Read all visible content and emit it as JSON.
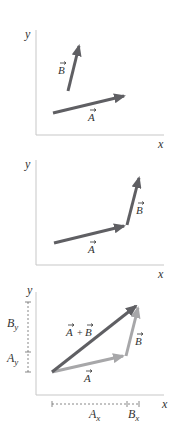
{
  "colors": {
    "vector_dark": "#5f5f63",
    "vector_light": "#a7a7a9",
    "axis": "#c7c7c7",
    "dashed": "#6a6a6a",
    "text": "#333333"
  },
  "panels": [
    {
      "axis_labels": {
        "x": "x",
        "y": "y"
      },
      "vectors": [
        {
          "name": "B",
          "label": "B"
        },
        {
          "name": "A",
          "label": "A"
        }
      ]
    },
    {
      "axis_labels": {
        "x": "x",
        "y": "y"
      },
      "vectors": [
        {
          "name": "A",
          "label": "A"
        },
        {
          "name": "B",
          "label": "B"
        }
      ]
    },
    {
      "axis_labels": {
        "x": "x",
        "y": "y"
      },
      "vectors": [
        {
          "name": "A",
          "label": "A"
        },
        {
          "name": "B",
          "label": "B"
        },
        {
          "name": "A+B",
          "label_a": "A",
          "plus": "+",
          "label_b": "B"
        }
      ],
      "components": {
        "Ax": {
          "main": "A",
          "sub": "x"
        },
        "Bx": {
          "main": "B",
          "sub": "x"
        },
        "Ay": {
          "main": "A",
          "sub": "y"
        },
        "By": {
          "main": "B",
          "sub": "y"
        }
      }
    }
  ]
}
